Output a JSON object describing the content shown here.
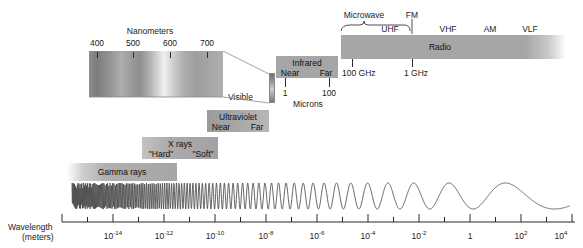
{
  "figure": {
    "title_visible": false,
    "kind": "electromagnetic-spectrum-diagram"
  },
  "visible_spectrum": {
    "scale_label": "Nanometers",
    "ticks": [
      "400",
      "500",
      "600",
      "700"
    ],
    "callout_label": "Visible"
  },
  "bands": {
    "infrared": {
      "label": "Infrared",
      "sub_near": "Near",
      "sub_far": "Far",
      "scale_label": "Microns",
      "scale_ticks": [
        "1",
        "100"
      ]
    },
    "radio": {
      "label": "Radio",
      "microwave_label": "Microwave",
      "sub_labels": [
        "UHF",
        "FM",
        "VHF",
        "AM",
        "VLF"
      ],
      "freq_ticks": [
        "100 GHz",
        "1 GHz"
      ]
    },
    "ultraviolet": {
      "label": "Ultraviolet",
      "sub_near": "Near",
      "sub_far": "Far"
    },
    "xrays": {
      "label": "X rays",
      "sub_hard": "\"Hard\"",
      "sub_soft": "\"Soft\""
    },
    "gamma": {
      "label": "Gamma rays"
    }
  },
  "axis": {
    "title_line1": "Wavelength",
    "title_line2": "(meters)",
    "ticks": [
      {
        "base": "10",
        "exp": "-14"
      },
      {
        "base": "10",
        "exp": "-12"
      },
      {
        "base": "10",
        "exp": "-10"
      },
      {
        "base": "10",
        "exp": "-8"
      },
      {
        "base": "10",
        "exp": "-6"
      },
      {
        "base": "10",
        "exp": "-4"
      },
      {
        "base": "10",
        "exp": "-2"
      },
      {
        "base": "1",
        "exp": ""
      },
      {
        "base": "10",
        "exp": "2"
      },
      {
        "base": "10",
        "exp": "4"
      }
    ]
  },
  "colors": {
    "band_fill": "#a8a8a8",
    "band_fill_light": "#c9c9c9",
    "ink": "#1a1a1a",
    "wave": "#4a4a4a",
    "background": "#ffffff"
  }
}
